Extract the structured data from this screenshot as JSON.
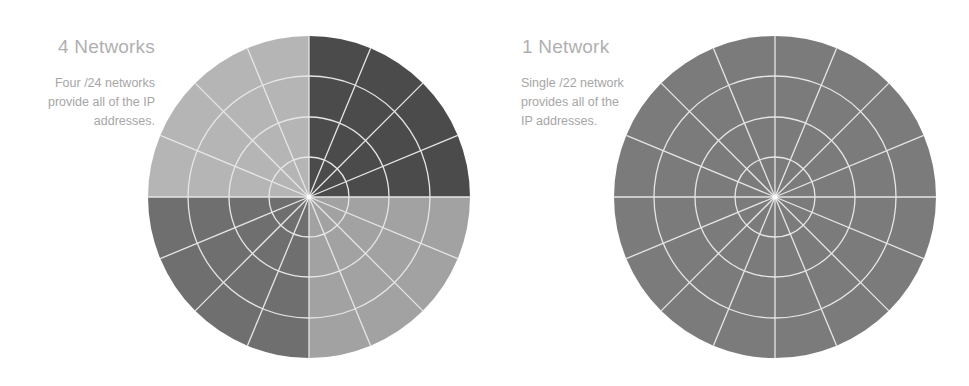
{
  "panels": [
    {
      "title": "4 Networks",
      "caption_lines": [
        "Four /24 networks",
        "provide all of the IP",
        "addresses."
      ],
      "center": [
        309,
        197
      ],
      "radius": 161,
      "quadrant_colors": {
        "top_left": "#b5b5b5",
        "top_right": "#4b4b4b",
        "bottom_left": "#6f6f6f",
        "bottom_right": "#a2a2a2"
      }
    },
    {
      "title": "1 Network",
      "caption_lines": [
        "Single /22 network",
        "provides all of the",
        "IP addresses."
      ],
      "center": [
        775,
        197
      ],
      "radius": 161,
      "fill_color": "#7b7b7b"
    }
  ],
  "grid": {
    "ring_radii": [
      40,
      80,
      121
    ],
    "spoke_count": 16,
    "line_color": "#e6e6e6"
  }
}
